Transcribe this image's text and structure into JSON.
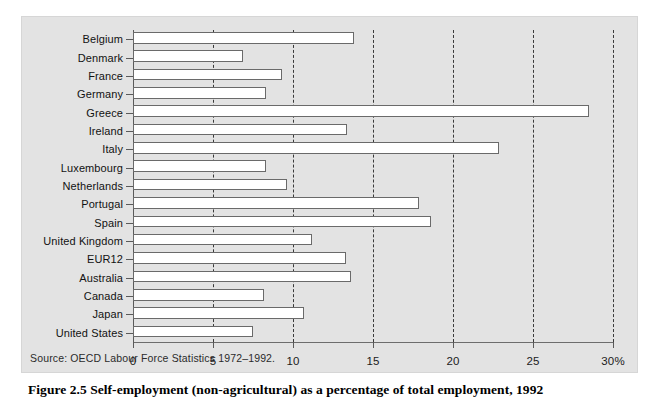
{
  "figure": {
    "caption": "Figure 2.5  Self-employment (non-agricultural) as a percentage of total employment, 1992",
    "source_note": "Source: OECD Labour Force Statistics 1972–1992.",
    "plate_color": "#e3e3e3",
    "bar_fill": "#ffffff",
    "bar_stroke": "#6a6a6a",
    "grid_color": "#3a3a3a"
  },
  "chart_data": {
    "type": "bar",
    "orientation": "horizontal",
    "title": "Figure 2.5  Self-employment (non-agricultural) as a percentage of total employment, 1992",
    "xlabel": "",
    "ylabel": "",
    "xlim": [
      0,
      30
    ],
    "xticks": [
      0,
      5,
      10,
      15,
      20,
      25,
      30
    ],
    "xtick_labels": [
      "0",
      "5",
      "10",
      "15",
      "20",
      "25",
      "30%"
    ],
    "grid": "vertical-dashed",
    "legend": "none",
    "categories": [
      "Belgium",
      "Denmark",
      "France",
      "Germany",
      "Greece",
      "Ireland",
      "Italy",
      "Luxembourg",
      "Netherlands",
      "Portugal",
      "Spain",
      "United Kingdom",
      "EUR12",
      "Australia",
      "Canada",
      "Japan",
      "United States"
    ],
    "values": [
      13.8,
      6.9,
      9.3,
      8.3,
      28.5,
      13.4,
      22.9,
      8.3,
      9.6,
      17.9,
      18.6,
      11.2,
      13.3,
      13.6,
      8.2,
      10.7,
      7.5
    ],
    "units": "percent"
  }
}
